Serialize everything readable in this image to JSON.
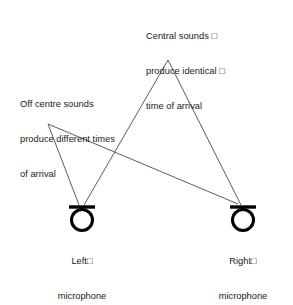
{
  "figure": {
    "background_color": "#ffffff",
    "ink_color": "#1a1a1a",
    "ray_color": "#4a4a4a"
  },
  "annotations": {
    "central": {
      "line1": "Central sounds □",
      "line2": "produce identical □",
      "line3": "time of arrival"
    },
    "off_centre": {
      "line1": "Off centre sounds",
      "line2": "produce different times",
      "line3": "of arrival"
    }
  },
  "microphones": [
    {
      "id": "left",
      "caption_line1": "Left□",
      "caption_line2": "microphone",
      "cx": 82,
      "cy": 220,
      "radius": 10.5,
      "bar_x1": 69,
      "bar_x2": 95,
      "bar_y": 207
    },
    {
      "id": "right",
      "caption_line1": "Right□",
      "caption_line2": "microphone",
      "cx": 243,
      "cy": 220,
      "radius": 10.5,
      "bar_x1": 230,
      "bar_x2": 256,
      "bar_y": 207
    }
  ],
  "sources": [
    {
      "id": "central-source",
      "x": 168,
      "y": 60
    },
    {
      "id": "off-centre-source",
      "x": 48,
      "y": 124
    }
  ],
  "rays": [
    {
      "id": "central-to-left",
      "x1": 168,
      "y1": 60,
      "x2": 84,
      "y2": 205
    },
    {
      "id": "central-to-right",
      "x1": 168,
      "y1": 60,
      "x2": 241,
      "y2": 205
    },
    {
      "id": "offcentre-to-left",
      "x1": 48,
      "y1": 124,
      "x2": 79,
      "y2": 205
    },
    {
      "id": "offcentre-to-right",
      "x1": 48,
      "y1": 124,
      "x2": 238,
      "y2": 204
    }
  ],
  "crossing_point": {
    "x": 110,
    "y": 148
  }
}
